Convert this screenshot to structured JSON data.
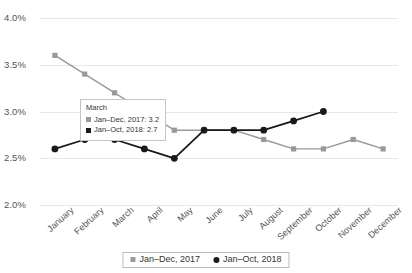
{
  "chart_data": {
    "type": "line",
    "title": "",
    "xlabel": "",
    "ylabel": "",
    "ylim": [
      2.0,
      4.0
    ],
    "ytick_values": [
      4.0,
      3.5,
      3.0,
      2.5,
      2.0
    ],
    "ytick_labels": [
      "4.0%",
      "3.5%",
      "3.0%",
      "2.5%",
      "2.0%"
    ],
    "grid": true,
    "legend_position": "bottom",
    "categories": [
      "January",
      "February",
      "March",
      "April",
      "May",
      "June",
      "July",
      "August",
      "September",
      "October",
      "November",
      "December"
    ],
    "series": [
      {
        "name": "Jan–Dec, 2017",
        "color": "#999999",
        "marker": "square",
        "values": [
          3.6,
          3.4,
          3.2,
          3.0,
          2.8,
          2.8,
          2.8,
          2.7,
          2.6,
          2.6,
          2.7,
          2.6
        ]
      },
      {
        "name": "Jan–Oct, 2018",
        "color": "#1a1a1a",
        "marker": "circle",
        "values": [
          2.6,
          2.7,
          2.7,
          2.6,
          2.5,
          2.8,
          2.8,
          2.8,
          2.9,
          3.0,
          null,
          null
        ]
      }
    ]
  },
  "tooltip": {
    "title": "March",
    "rows": [
      {
        "label": "Jan–Dec, 2017: 3.2",
        "color": "#999999"
      },
      {
        "label": "Jan–Oct, 2018: 2.7",
        "color": "#1a1a1a"
      }
    ]
  },
  "legend": {
    "entries": [
      {
        "label": "Jan–Dec, 2017"
      },
      {
        "label": "Jan–Oct, 2018"
      }
    ]
  }
}
